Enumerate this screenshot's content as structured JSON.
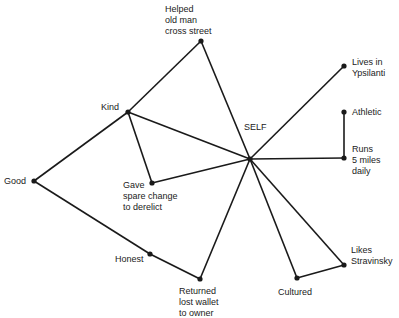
{
  "diagram": {
    "center": {
      "id": "self",
      "label": "SELF",
      "x": 250,
      "y": 159
    },
    "nodes": [
      {
        "id": "helped",
        "label": "Helped\nold man\ncross street",
        "x": 201,
        "y": 41,
        "lx": 165,
        "ly": 4
      },
      {
        "id": "lives",
        "label": "Lives in\nYpsilanti",
        "x": 344,
        "y": 66,
        "lx": 352,
        "ly": 57
      },
      {
        "id": "athletic",
        "label": "Athletic",
        "x": 344,
        "y": 112,
        "lx": 352,
        "ly": 107
      },
      {
        "id": "runs",
        "label": "Runs\n5 miles\ndaily",
        "x": 344,
        "y": 158,
        "lx": 352,
        "ly": 144
      },
      {
        "id": "kind",
        "label": "Kind",
        "x": 128,
        "y": 112,
        "lx": 101,
        "ly": 102
      },
      {
        "id": "good",
        "label": "Good",
        "x": 34,
        "y": 181,
        "lx": 4,
        "ly": 176
      },
      {
        "id": "gave",
        "label": "Gave\nspare change\nto derelict",
        "x": 152,
        "y": 183,
        "lx": 123,
        "ly": 180
      },
      {
        "id": "honest",
        "label": "Honest",
        "x": 150,
        "y": 254,
        "lx": 115,
        "ly": 254
      },
      {
        "id": "returned",
        "label": "Returned\nlost wallet\nto owner",
        "x": 200,
        "y": 279,
        "lx": 179,
        "ly": 286
      },
      {
        "id": "cultured",
        "label": "Cultured",
        "x": 297,
        "y": 278,
        "lx": 278,
        "ly": 287
      },
      {
        "id": "likes",
        "label": "Likes\nStravinsky",
        "x": 344,
        "y": 265,
        "lx": 351,
        "ly": 245
      }
    ],
    "self_label": {
      "text": "SELF",
      "lx": 244,
      "ly": 122
    },
    "edges": [
      [
        "self",
        "helped"
      ],
      [
        "self",
        "lives"
      ],
      [
        "self",
        "runs"
      ],
      [
        "runs",
        "athletic"
      ],
      [
        "self",
        "kind"
      ],
      [
        "self",
        "gave"
      ],
      [
        "kind",
        "gave"
      ],
      [
        "kind",
        "helped"
      ],
      [
        "kind",
        "good"
      ],
      [
        "good",
        "honest"
      ],
      [
        "honest",
        "returned"
      ],
      [
        "self",
        "returned"
      ],
      [
        "self",
        "cultured"
      ],
      [
        "self",
        "likes"
      ],
      [
        "cultured",
        "likes"
      ]
    ],
    "colors": {
      "line": "#1a1a1a",
      "text": "#222222"
    }
  }
}
